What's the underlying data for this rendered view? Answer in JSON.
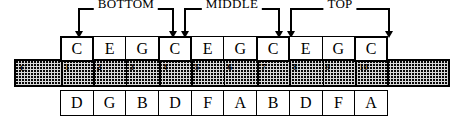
{
  "diagram": {
    "brackets": [
      {
        "label": "BOTTOM",
        "left": 78,
        "width": 96,
        "arrow_left": true,
        "arrow_right": true
      },
      {
        "label": "MIDDLE",
        "left": 184,
        "width": 96,
        "arrow_left": true,
        "arrow_right": true
      },
      {
        "label": "TOP",
        "left": 290,
        "width": 100,
        "arrow_left": true,
        "arrow_right": true
      }
    ],
    "blow_row": {
      "name": "blow-notes",
      "notes": [
        "C",
        "E",
        "G",
        "C",
        "E",
        "G",
        "C",
        "E",
        "G",
        "C"
      ],
      "emphasized": [
        true,
        false,
        false,
        true,
        false,
        false,
        true,
        false,
        false,
        true
      ]
    },
    "hole_row": {
      "name": "hole-numbers",
      "left_label": "C",
      "numbers": [
        "1",
        "2",
        "3",
        "4",
        "5",
        "6",
        "7",
        "8",
        "9",
        "10"
      ],
      "emphasized": [
        true,
        false,
        false,
        true,
        false,
        false,
        true,
        false,
        false,
        true
      ]
    },
    "draw_row": {
      "name": "draw-notes",
      "notes": [
        "D",
        "G",
        "B",
        "D",
        "F",
        "A",
        "B",
        "D",
        "F",
        "A"
      ],
      "emphasized": [
        false,
        false,
        false,
        false,
        false,
        false,
        false,
        false,
        false,
        false
      ]
    },
    "colors": {
      "ink": "#000000",
      "paper": "#ffffff",
      "rail_fill": "#d8d8d8"
    }
  }
}
